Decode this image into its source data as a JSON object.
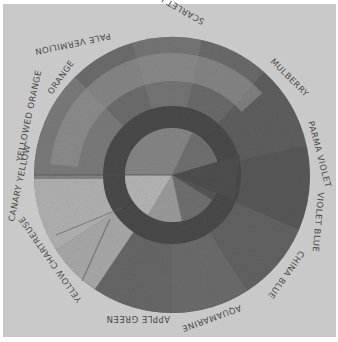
{
  "image": {
    "description": "Grayscale photograph of a hand-drawn colored-pencil color wheel",
    "labels": [
      {
        "text": "PALE VERMILION",
        "x": 127,
        "y": 28,
        "rot": -12
      },
      {
        "text": "SCARLET LAKE",
        "x": 218,
        "y": 28,
        "rot": 30
      },
      {
        "text": "MULBERRY",
        "x": 275,
        "y": 75,
        "rot": 55
      },
      {
        "text": "PARMA VIOLET",
        "x": 313,
        "y": 140,
        "rot": 80
      },
      {
        "text": "VIOLET BLUE",
        "x": 318,
        "y": 215,
        "rot": 100
      },
      {
        "text": "CHINA BLUE",
        "x": 282,
        "y": 268,
        "rot": 128
      },
      {
        "text": "AQUAMARINE",
        "x": 212,
        "y": 308,
        "rot": 160
      },
      {
        "text": "APPLE GREEN",
        "x": 140,
        "y": 308,
        "rot": 190
      },
      {
        "text": "YELLOW CHARTREUSE",
        "x": 65,
        "y": 272,
        "rot": 235
      },
      {
        "text": "CANARY YELLOW",
        "x": 24,
        "y": 203,
        "rot": 260
      },
      {
        "text": "YELLOWED ORANGE",
        "x": 26,
        "y": 128,
        "rot": 280
      },
      {
        "text": "ORANGE",
        "x": 62,
        "y": 72,
        "rot": 305
      }
    ]
  }
}
